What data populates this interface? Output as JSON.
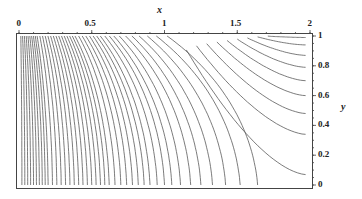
{
  "chart_data": {
    "type": "contour",
    "title": "",
    "xlabel": "x",
    "ylabel": "y",
    "xlim": [
      0,
      2
    ],
    "ylim": [
      0,
      1
    ],
    "x_ticks": [
      "0",
      "0.5",
      "1",
      "1.5",
      "2"
    ],
    "y_ticks": [
      "0",
      "0.2",
      "0.4",
      "0.6",
      "0.8",
      "1"
    ],
    "x_axis_position": "top",
    "y_axis_position": "right",
    "grid": false,
    "legend": null,
    "line_color": "#555555",
    "contour_count_approx": 48,
    "note": "Contour lines shown are an approximate visual reconstruction; the underlying function is not labeled in the image",
    "bottom_crossings_x": [
      0.02,
      0.04,
      0.06,
      0.08,
      0.1,
      0.12,
      0.14,
      0.16,
      0.18,
      0.2,
      0.23,
      0.26,
      0.29,
      0.32,
      0.35,
      0.38,
      0.41,
      0.44,
      0.47,
      0.5,
      0.53,
      0.56,
      0.59,
      0.62,
      0.66,
      0.7,
      0.74,
      0.78,
      0.82,
      0.86,
      0.9,
      0.95,
      1.0,
      1.05,
      1.11,
      1.18,
      1.25,
      1.33,
      1.42,
      1.52,
      1.64
    ],
    "right_edge_contours_y": [
      0.07,
      0.34,
      0.48,
      0.6,
      0.7,
      0.79,
      0.87,
      0.94,
      0.99
    ]
  }
}
